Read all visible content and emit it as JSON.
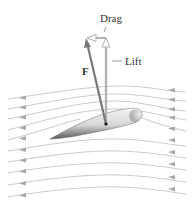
{
  "figure": {
    "labels": {
      "drag": "Drag",
      "lift": "Lift",
      "force": "F"
    },
    "colors": {
      "background": "#ffffff",
      "streamline": "#b8b8b8",
      "streamline_arrow": "#a8a8a8",
      "force_vector": "#7a7a7a",
      "lift_vector": "#b0b0b0",
      "drag_vector": "#b0b0b0",
      "airfoil_light": "#eeeeee",
      "airfoil_dark": "#555555",
      "label_text": "#333333",
      "origin_point": "#111111"
    },
    "origin_point": {
      "x": 106,
      "y": 124
    },
    "vectors": {
      "force": {
        "from": [
          106,
          124
        ],
        "to": [
          86,
          39
        ]
      },
      "lift": {
        "from": [
          106,
          124
        ],
        "to": [
          106,
          40
        ]
      },
      "drag": {
        "from": [
          106,
          38
        ],
        "to": [
          87,
          38
        ]
      }
    },
    "streamlines_count": 11
  }
}
